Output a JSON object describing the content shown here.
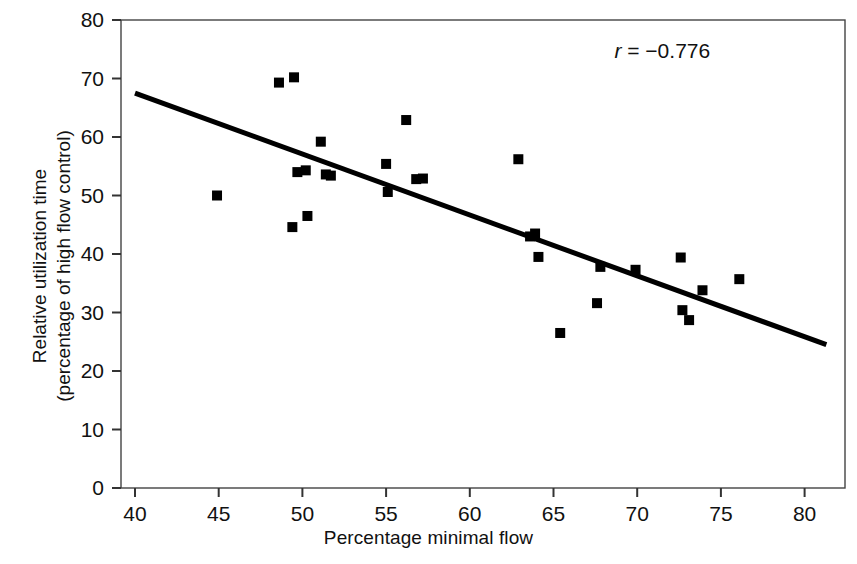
{
  "chart_data": {
    "type": "scatter",
    "title": "",
    "xlabel": "Percentage minimal flow",
    "ylabel_line1": "Relative utilization time",
    "ylabel_line2": "(percentage of high flow control)",
    "xlim": [
      38.5,
      81.5
    ],
    "ylim": [
      0,
      80
    ],
    "xticks": [
      40,
      45,
      50,
      55,
      60,
      65,
      70,
      75,
      80
    ],
    "yticks": [
      0,
      10,
      20,
      30,
      40,
      50,
      60,
      70,
      80
    ],
    "xticklabels": [
      "40",
      "45",
      "50",
      "55",
      "60",
      "65",
      "70",
      "75",
      "80"
    ],
    "yticklabels": [
      "0",
      "10",
      "20",
      "30",
      "40",
      "50",
      "60",
      "70",
      "80"
    ],
    "grid": false,
    "legend": false,
    "marker": "square",
    "marker_color": "#000000",
    "annotations": [
      {
        "name": "correlation-coefficient",
        "text": "r = −0.776",
        "x": 71.5,
        "y": 73.5
      }
    ],
    "series": [
      {
        "name": "observations",
        "type": "scatter",
        "points": [
          [
            44.9,
            50.0
          ],
          [
            48.6,
            69.3
          ],
          [
            49.5,
            70.2
          ],
          [
            49.4,
            44.6
          ],
          [
            49.7,
            54.0
          ],
          [
            50.2,
            54.3
          ],
          [
            50.3,
            46.5
          ],
          [
            51.1,
            59.2
          ],
          [
            51.4,
            53.6
          ],
          [
            51.7,
            53.4
          ],
          [
            55.0,
            55.4
          ],
          [
            55.1,
            50.6
          ],
          [
            56.2,
            62.9
          ],
          [
            56.8,
            52.8
          ],
          [
            57.2,
            52.9
          ],
          [
            62.9,
            56.2
          ],
          [
            63.6,
            43.0
          ],
          [
            63.9,
            43.5
          ],
          [
            64.1,
            39.5
          ],
          [
            65.4,
            26.5
          ],
          [
            67.6,
            31.6
          ],
          [
            67.8,
            37.8
          ],
          [
            69.9,
            37.3
          ],
          [
            72.6,
            39.4
          ],
          [
            72.7,
            30.4
          ],
          [
            73.1,
            28.7
          ],
          [
            73.9,
            33.8
          ],
          [
            76.1,
            35.7
          ]
        ]
      },
      {
        "name": "regression-line",
        "type": "line",
        "x_start": 40.0,
        "y_start": 67.5,
        "x_end": 81.3,
        "y_end": 24.5,
        "color": "#000000",
        "width": 5
      }
    ]
  },
  "axes": {
    "frame_color": "#444444",
    "tick_color": "#333333",
    "tick_label_size": "21px"
  }
}
